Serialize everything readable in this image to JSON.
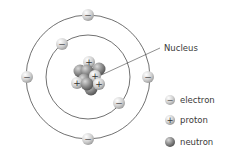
{
  "diagram": {
    "type": "atom-bohr-model",
    "nucleus_label": "Nucleus",
    "orbits": [
      {
        "name": "inner-orbit",
        "electrons": 2
      },
      {
        "name": "outer-orbit",
        "electrons": 4
      }
    ],
    "nucleus": {
      "protons": 5,
      "neutrons": 6
    }
  },
  "legend": {
    "items": [
      {
        "symbol": "−",
        "label": "electron"
      },
      {
        "symbol": "+",
        "label": "proton"
      },
      {
        "symbol": "",
        "label": "neutron"
      }
    ]
  },
  "colors": {
    "orbit": "#333333",
    "particle_light": "#f2f2f2",
    "particle_dark": "#8a8a8a",
    "text": "#3a3a3a"
  }
}
